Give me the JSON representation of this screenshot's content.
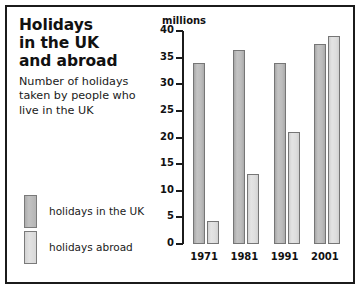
{
  "title": {
    "lines": [
      "Holidays",
      "in the UK",
      "and abroad"
    ]
  },
  "subtitle": {
    "lines": [
      "Number of holidays",
      "taken by people who",
      "live in the UK"
    ]
  },
  "units_label": "millions",
  "legend": {
    "items": [
      {
        "label": "holidays in the UK",
        "color": "#bdbdbd"
      },
      {
        "label": "holidays abroad",
        "color": "#dedede"
      }
    ]
  },
  "chart_data": {
    "type": "bar",
    "title": "Holidays in the UK and abroad",
    "subtitle": "Number of holidays taken by people who live in the UK",
    "categories": [
      "1971",
      "1981",
      "1991",
      "2001"
    ],
    "series": [
      {
        "name": "holidays in the UK",
        "values": [
          34,
          36.5,
          34,
          37.5
        ],
        "color": "#bdbdbd"
      },
      {
        "name": "holidays abroad",
        "values": [
          4.3,
          13.2,
          21,
          39
        ],
        "color": "#dedede"
      }
    ],
    "xlabel": "",
    "ylabel": "millions",
    "ylim": [
      0,
      40
    ],
    "yticks": [
      0,
      5,
      10,
      15,
      20,
      25,
      30,
      35,
      40
    ],
    "ytick_labels": [
      "0",
      "5",
      "10",
      "15",
      "20",
      "25",
      "30",
      "35",
      "40"
    ],
    "grid": false,
    "legend_position": "left"
  }
}
